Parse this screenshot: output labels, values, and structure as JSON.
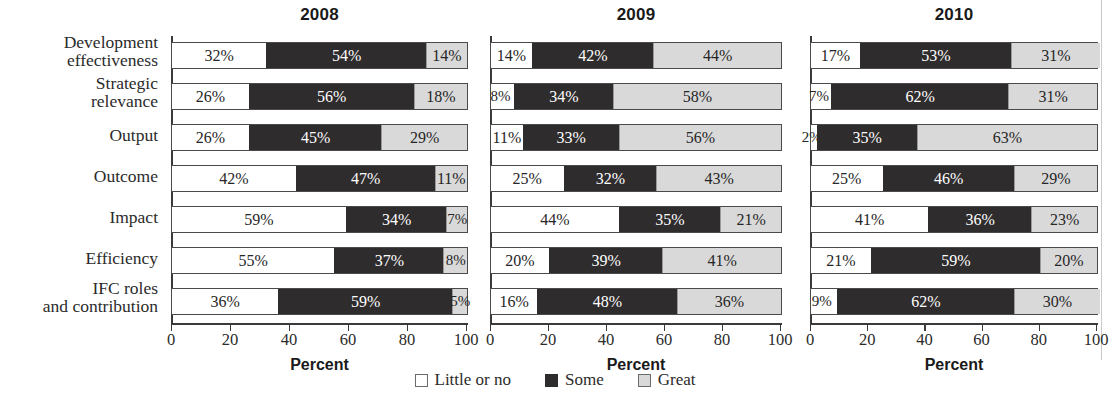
{
  "chart_data": {
    "type": "bar",
    "subtype": "stacked-horizontal-100",
    "title": "",
    "xlabel": "Percent",
    "ylabel": "",
    "xlim": [
      0,
      100
    ],
    "xticks": [
      0,
      20,
      40,
      60,
      80,
      100
    ],
    "grid": false,
    "legend_position": "bottom-center",
    "categories": [
      "Development effectiveness",
      "Strategic relevance",
      "Output",
      "Outcome",
      "Impact",
      "Efficiency",
      "IFC roles and contribution"
    ],
    "legend": [
      "Little or no",
      "Some",
      "Great"
    ],
    "panels": [
      {
        "title": "2008",
        "series": [
          {
            "name": "Little or no",
            "values": [
              32,
              26,
              26,
              42,
              59,
              55,
              36
            ]
          },
          {
            "name": "Some",
            "values": [
              54,
              56,
              45,
              47,
              34,
              37,
              59
            ]
          },
          {
            "name": "Great",
            "values": [
              14,
              18,
              29,
              11,
              7,
              8,
              5
            ]
          }
        ]
      },
      {
        "title": "2009",
        "series": [
          {
            "name": "Little or no",
            "values": [
              14,
              8,
              11,
              25,
              44,
              20,
              16
            ]
          },
          {
            "name": "Some",
            "values": [
              42,
              34,
              33,
              32,
              35,
              39,
              48
            ]
          },
          {
            "name": "Great",
            "values": [
              44,
              58,
              56,
              43,
              21,
              41,
              36
            ]
          }
        ]
      },
      {
        "title": "2010",
        "series": [
          {
            "name": "Little or no",
            "values": [
              17,
              7,
              2,
              25,
              41,
              21,
              9
            ]
          },
          {
            "name": "Some",
            "values": [
              53,
              62,
              35,
              46,
              36,
              59,
              62
            ]
          },
          {
            "name": "Great",
            "values": [
              31,
              31,
              63,
              29,
              23,
              20,
              30
            ]
          }
        ]
      }
    ],
    "colors": {
      "little_or_no": "#ffffff",
      "some": "#2f2c2d",
      "great": "#d9d9d9",
      "axis": "#3a3a3a",
      "text": "#262626"
    }
  },
  "row_labels": [
    {
      "line1": "Development",
      "line2": "effectiveness"
    },
    {
      "line1": "Strategic",
      "line2": "relevance"
    },
    {
      "line1": "Output",
      "line2": ""
    },
    {
      "line1": "Outcome",
      "line2": ""
    },
    {
      "line1": "Impact",
      "line2": ""
    },
    {
      "line1": "Efficiency",
      "line2": ""
    },
    {
      "line1": "IFC roles",
      "line2": "and contribution"
    }
  ],
  "panel_titles": [
    "2008",
    "2009",
    "2010"
  ],
  "axis_title": "Percent",
  "tick_labels": [
    "0",
    "20",
    "40",
    "60",
    "80",
    "100"
  ],
  "legend_labels": [
    "Little or no",
    "Some",
    "Great"
  ],
  "value_labels": {
    "p0": [
      [
        "32%",
        "54%",
        "14%"
      ],
      [
        "26%",
        "56%",
        "18%"
      ],
      [
        "26%",
        "45%",
        "29%"
      ],
      [
        "42%",
        "47%",
        "11%"
      ],
      [
        "59%",
        "34%",
        "7%"
      ],
      [
        "55%",
        "37%",
        "8%"
      ],
      [
        "36%",
        "59%",
        "5%"
      ]
    ],
    "p1": [
      [
        "14%",
        "42%",
        "44%"
      ],
      [
        "8%",
        "34%",
        "58%"
      ],
      [
        "11%",
        "33%",
        "56%"
      ],
      [
        "25%",
        "32%",
        "43%"
      ],
      [
        "44%",
        "35%",
        "21%"
      ],
      [
        "20%",
        "39%",
        "41%"
      ],
      [
        "16%",
        "48%",
        "36%"
      ]
    ],
    "p2": [
      [
        "17%",
        "53%",
        "31%"
      ],
      [
        "7%",
        "62%",
        "31%"
      ],
      [
        "2%",
        "35%",
        "63%"
      ],
      [
        "25%",
        "46%",
        "29%"
      ],
      [
        "41%",
        "36%",
        "23%"
      ],
      [
        "21%",
        "59%",
        "20%"
      ],
      [
        "9%",
        "62%",
        "30%"
      ]
    ]
  }
}
